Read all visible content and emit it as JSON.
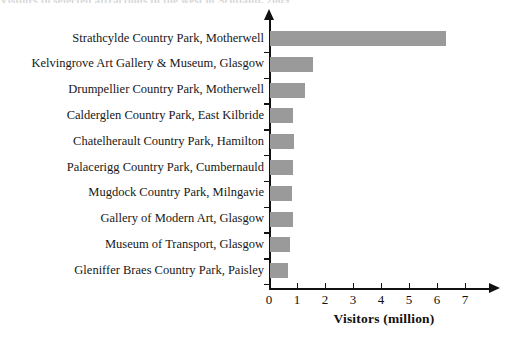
{
  "top_clipped_text": "Visitors to selected attractions in the west of Scotland, 2009",
  "chart_data": {
    "type": "bar",
    "orientation": "horizontal",
    "title": "",
    "xlabel": "Visitors (million)",
    "ylabel": "",
    "xlim": [
      0,
      7.6
    ],
    "xticks": [
      0,
      1,
      2,
      3,
      4,
      5,
      6,
      7
    ],
    "xtick_labels": [
      "0",
      "1",
      "2",
      "3",
      "4",
      "5",
      "6",
      "7"
    ],
    "grid": false,
    "legend": false,
    "bar_color": "#9a9a9a",
    "axis_color": "#111111",
    "categories": [
      "Strathcylde Country Park, Motherwell",
      "Kelvingrove Art Gallery & Museum, Glasgow",
      "Drumpellier Country Park, Motherwell",
      "Calderglen Country Park, East Kilbride",
      "Chatelherault Country Park, Hamilton",
      "Palacerigg Country Park, Cumbernauld",
      "Mugdock Country Park, Milngavie",
      "Gallery of Modern Art, Glasgow",
      "Museum of Transport, Glasgow",
      "Gleniffer Braes Country Park, Paisley"
    ],
    "values": [
      6.3,
      1.55,
      1.25,
      0.82,
      0.86,
      0.82,
      0.79,
      0.82,
      0.71,
      0.64
    ]
  }
}
